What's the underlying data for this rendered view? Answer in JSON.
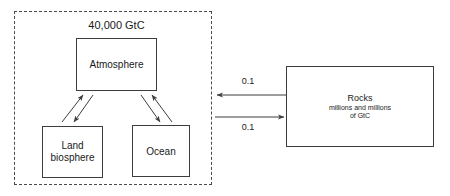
{
  "diagram": {
    "title": "40,000 GtC",
    "region": {
      "name": "fast carbon cycle region",
      "style": "dashed"
    },
    "boxes": {
      "atmosphere": {
        "label": "Atmosphere"
      },
      "land_biosphere": {
        "line1": "Land",
        "line2": "biosphere"
      },
      "ocean": {
        "label": "Ocean"
      },
      "rocks": {
        "title": "Rocks",
        "subtitle_line1": "millions and millions",
        "subtitle_line2": "of GtC"
      }
    },
    "fluxes": {
      "rocks_to_atmosphere": "0.1",
      "atmosphere_to_rocks": "0.1"
    },
    "colors": {
      "stroke": "#3d3d3d",
      "dashed_stroke": "#4a4a4a",
      "text": "#1a1a1a",
      "background": "#ffffff"
    }
  }
}
